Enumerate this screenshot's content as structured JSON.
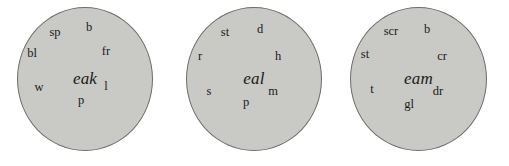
{
  "figure": {
    "type": "word-family-wheels",
    "background_color": "#ffffff",
    "wheel_fill_color": "#c9c9c6",
    "wheel_border_color": "#6d6d6a",
    "text_color": "#1a1a1a"
  },
  "wheels": [
    {
      "id": "wheel-eak",
      "rime": "eak",
      "geometry": {
        "left": 17,
        "top": 7,
        "width": 136,
        "height": 144
      },
      "onsets": [
        {
          "label": "sp",
          "x": 37,
          "y": 24
        },
        {
          "label": "b",
          "x": 71,
          "y": 19
        },
        {
          "label": "fr",
          "x": 88,
          "y": 43
        },
        {
          "label": "l",
          "x": 88,
          "y": 78
        },
        {
          "label": "p",
          "x": 63,
          "y": 92
        },
        {
          "label": "w",
          "x": 21,
          "y": 79
        },
        {
          "label": "bl",
          "x": 14,
          "y": 45
        }
      ]
    },
    {
      "id": "wheel-eal",
      "rime": "eal",
      "geometry": {
        "left": 186,
        "top": 7,
        "width": 136,
        "height": 144
      },
      "onsets": [
        {
          "label": "st",
          "x": 38,
          "y": 24
        },
        {
          "label": "d",
          "x": 73,
          "y": 21
        },
        {
          "label": "h",
          "x": 91,
          "y": 48
        },
        {
          "label": "m",
          "x": 86,
          "y": 83
        },
        {
          "label": "p",
          "x": 59,
          "y": 94
        },
        {
          "label": "s",
          "x": 22,
          "y": 83
        },
        {
          "label": "r",
          "x": 13,
          "y": 48
        }
      ]
    },
    {
      "id": "wheel-eam",
      "rime": "eam",
      "geometry": {
        "left": 350,
        "top": 7,
        "width": 137,
        "height": 144
      },
      "onsets": [
        {
          "label": "scr",
          "x": 40,
          "y": 23
        },
        {
          "label": "b",
          "x": 76,
          "y": 21
        },
        {
          "label": "cr",
          "x": 91,
          "y": 48
        },
        {
          "label": "dr",
          "x": 87,
          "y": 83
        },
        {
          "label": "gl",
          "x": 58,
          "y": 96
        },
        {
          "label": "t",
          "x": 21,
          "y": 81
        },
        {
          "label": "st",
          "x": 14,
          "y": 46
        }
      ]
    }
  ]
}
